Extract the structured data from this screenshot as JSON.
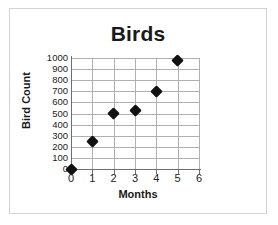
{
  "chart_data": {
    "type": "scatter",
    "title": "Birds",
    "xlabel": "Months",
    "ylabel": "Bird Count",
    "x": [
      0,
      1,
      2,
      3,
      4,
      5
    ],
    "values": [
      0,
      250,
      500,
      525,
      700,
      975
    ],
    "points": [
      {
        "x": 0,
        "y": 0
      },
      {
        "x": 1,
        "y": 250
      },
      {
        "x": 2,
        "y": 500
      },
      {
        "x": 3,
        "y": 525
      },
      {
        "x": 4,
        "y": 700
      },
      {
        "x": 5,
        "y": 975
      }
    ],
    "xlim": [
      0,
      6
    ],
    "ylim": [
      0,
      1000
    ],
    "xticks": [
      "0",
      "1",
      "2",
      "3",
      "4",
      "5",
      "6"
    ],
    "yticks": [
      "0",
      "100",
      "200",
      "300",
      "400",
      "500",
      "600",
      "700",
      "800",
      "900",
      "1000"
    ],
    "xtick_values": [
      0,
      1,
      2,
      3,
      4,
      5,
      6
    ],
    "ytick_values": [
      0,
      100,
      200,
      300,
      400,
      500,
      600,
      700,
      800,
      900,
      1000
    ],
    "grid": true,
    "legend": null,
    "marker": "diamond",
    "marker_color": "#111111",
    "grid_color": "#b0b0b0",
    "axis_color": "#6e6e6e",
    "border_color": "#d4d4d4",
    "background_color": "#ffffff"
  }
}
